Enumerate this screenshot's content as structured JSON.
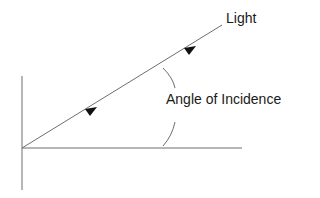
{
  "diagram": {
    "labels": {
      "light": "Light",
      "angle": "Angle of Incidence"
    },
    "colors": {
      "line": "#6e6e6e",
      "arrow": "#111111",
      "text": "#1a1a1a",
      "background": "#ffffff"
    }
  }
}
